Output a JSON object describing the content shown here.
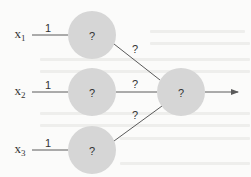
{
  "diagram": {
    "type": "neural-network",
    "colors": {
      "node_fill": "#d6d6d6",
      "edge": "#5a5a5a",
      "text": "#333333",
      "background": "#fbfbfa"
    },
    "inputs": [
      {
        "var": "x",
        "sub": "1",
        "weight": "1",
        "x": 19,
        "y": 35
      },
      {
        "var": "x",
        "sub": "2",
        "weight": "1",
        "x": 19,
        "y": 92
      },
      {
        "var": "x",
        "sub": "3",
        "weight": "1",
        "x": 19,
        "y": 150
      }
    ],
    "hidden_nodes": [
      {
        "label": "?",
        "cx": 92,
        "cy": 35
      },
      {
        "label": "?",
        "cx": 92,
        "cy": 92
      },
      {
        "label": "?",
        "cx": 92,
        "cy": 150
      }
    ],
    "output_node": {
      "label": "?",
      "cx": 181,
      "cy": 92
    },
    "hidden_to_output_weights": [
      "?",
      "?",
      "?"
    ],
    "node_radius": 24
  }
}
